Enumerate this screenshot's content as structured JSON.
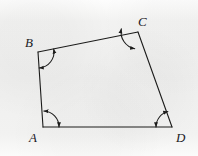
{
  "figure": {
    "kind": "geometry-diagram",
    "shape": "quadrilateral",
    "background_color": "#f1f1f0",
    "ink_color": "#1c1c1b",
    "stroke_width": 1.1,
    "canvas": {
      "width": 198,
      "height": 156
    },
    "vertices": [
      {
        "id": "A",
        "label": "A",
        "x": 43,
        "y": 127,
        "label_x": 29,
        "label_y": 131
      },
      {
        "id": "B",
        "label": "B",
        "x": 38,
        "y": 52,
        "label_x": 25,
        "label_y": 36
      },
      {
        "id": "C",
        "label": "C",
        "x": 138,
        "y": 32,
        "label_x": 138,
        "label_y": 15
      },
      {
        "id": "D",
        "label": "D",
        "x": 172,
        "y": 127,
        "label_x": 176,
        "label_y": 131
      }
    ],
    "edges": [
      {
        "id": "AB",
        "from": "A",
        "to": "B"
      },
      {
        "id": "BC",
        "from": "B",
        "to": "C"
      },
      {
        "id": "CD",
        "from": "C",
        "to": "D"
      },
      {
        "id": "DA",
        "from": "D",
        "to": "A"
      }
    ],
    "angle_marks": [
      {
        "at": "A",
        "style": "arc-with-arrowheads",
        "radius": 16,
        "start_deg": -87,
        "end_deg": 0,
        "arrow_both_ends": true
      },
      {
        "at": "B",
        "style": "arc-with-arrowheads",
        "radius": 16,
        "start_deg": -11,
        "end_deg": 86,
        "arrow_both_ends": true
      },
      {
        "at": "C",
        "style": "arc-with-arrowheads",
        "radius": 17,
        "start_deg": 101,
        "end_deg": 191,
        "arrow_both_ends": true
      },
      {
        "at": "D",
        "style": "arc-with-arrowheads",
        "radius": 16,
        "start_deg": 180,
        "end_deg": 255,
        "arrow_both_ends": true
      }
    ]
  }
}
